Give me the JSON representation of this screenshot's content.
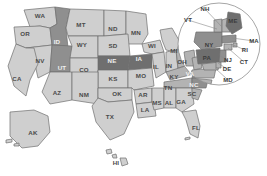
{
  "map": {
    "title_partial": "Percentage of Households, by State",
    "title_visible": false,
    "projection": "albers-usa",
    "background_color": "#ffffff",
    "border_color": "#6e6e6e",
    "shade_levels": {
      "light": "#cfcfcf",
      "medium": "#b3b3b3",
      "dark": "#8f8f8f",
      "darkest": "#6f6f6f"
    },
    "inset": {
      "name": "northeast-inset",
      "shape": "circle",
      "center_x": 219,
      "center_y": 44,
      "radius": 41
    },
    "states": [
      {
        "code": "WA",
        "shade": "light",
        "lx": 40,
        "ly": 16
      },
      {
        "code": "OR",
        "shade": "light",
        "lx": 25,
        "ly": 34
      },
      {
        "code": "ID",
        "shade": "dark",
        "lx": 57,
        "ly": 42
      },
      {
        "code": "MT",
        "shade": "light",
        "lx": 81,
        "ly": 25
      },
      {
        "code": "ND",
        "shade": "light",
        "lx": 113,
        "ly": 29
      },
      {
        "code": "MN",
        "shade": "light",
        "lx": 136,
        "ly": 33
      },
      {
        "code": "WI",
        "shade": "light",
        "lx": 152,
        "ly": 46
      },
      {
        "code": "MI",
        "shade": "light",
        "lx": 174,
        "ly": 51
      },
      {
        "code": "NV",
        "shade": "light",
        "lx": 40,
        "ly": 61
      },
      {
        "code": "UT",
        "shade": "dark",
        "lx": 62,
        "ly": 68
      },
      {
        "code": "WY",
        "shade": "light",
        "lx": 82,
        "ly": 45
      },
      {
        "code": "SD",
        "shade": "light",
        "lx": 113,
        "ly": 46
      },
      {
        "code": "NE",
        "shade": "darkest",
        "lx": 112,
        "ly": 61
      },
      {
        "code": "IA",
        "shade": "darkest",
        "lx": 139,
        "ly": 59
      },
      {
        "code": "CA",
        "shade": "light",
        "lx": 17,
        "ly": 79
      },
      {
        "code": "CO",
        "shade": "light",
        "lx": 84,
        "ly": 70
      },
      {
        "code": "KS",
        "shade": "light",
        "lx": 113,
        "ly": 79
      },
      {
        "code": "MO",
        "shade": "light",
        "lx": 141,
        "ly": 76
      },
      {
        "code": "IL",
        "shade": "light",
        "lx": 156,
        "ly": 67
      },
      {
        "code": "IN",
        "shade": "light",
        "lx": 169,
        "ly": 66
      },
      {
        "code": "OH",
        "shade": "medium",
        "lx": 182,
        "ly": 62
      },
      {
        "code": "AZ",
        "shade": "light",
        "lx": 57,
        "ly": 93
      },
      {
        "code": "NM",
        "shade": "light",
        "lx": 84,
        "ly": 95
      },
      {
        "code": "OK",
        "shade": "light",
        "lx": 117,
        "ly": 94
      },
      {
        "code": "AR",
        "shade": "light",
        "lx": 143,
        "ly": 95
      },
      {
        "code": "KY",
        "shade": "medium",
        "lx": 174,
        "ly": 77
      },
      {
        "code": "TN",
        "shade": "medium",
        "lx": 168,
        "ly": 88
      },
      {
        "code": "TX",
        "shade": "light",
        "lx": 110,
        "ly": 117
      },
      {
        "code": "LA",
        "shade": "light",
        "lx": 145,
        "ly": 110
      },
      {
        "code": "MS",
        "shade": "light",
        "lx": 157,
        "ly": 103
      },
      {
        "code": "AL",
        "shade": "light",
        "lx": 169,
        "ly": 103
      },
      {
        "code": "GA",
        "shade": "light",
        "lx": 181,
        "ly": 102
      },
      {
        "code": "FL",
        "shade": "light",
        "lx": 196,
        "ly": 128
      },
      {
        "code": "SC",
        "shade": "medium",
        "lx": 192,
        "ly": 94
      },
      {
        "code": "NC",
        "shade": "dark",
        "lx": 194,
        "ly": 85
      },
      {
        "code": "VA",
        "shade": "dark",
        "lx": 190,
        "ly": 74
      },
      {
        "code": "AK",
        "shade": "light",
        "lx": 33,
        "ly": 133
      },
      {
        "code": "HI",
        "shade": "light",
        "lx": 116,
        "ly": 163
      }
    ],
    "inset_states": [
      {
        "code": "ME",
        "shade": "darkest",
        "lx": 233,
        "ly": 21,
        "leader": false
      },
      {
        "code": "NY",
        "shade": "dark",
        "lx": 209,
        "ly": 45,
        "leader": false
      },
      {
        "code": "PA",
        "shade": "darkest",
        "lx": 207,
        "ly": 58,
        "leader": false
      },
      {
        "code": "VT",
        "shade": "medium",
        "lx": 188,
        "ly": 20,
        "leader": true,
        "lx2": 217,
        "ly2": 29
      },
      {
        "code": "NH",
        "shade": "medium",
        "lx": 205,
        "ly": 9,
        "leader": true,
        "lx2": 222,
        "ly2": 27
      },
      {
        "code": "MA",
        "shade": "dark",
        "lx": 254,
        "ly": 41,
        "leader": true,
        "lx2": 232,
        "ly2": 38
      },
      {
        "code": "RI",
        "shade": "medium",
        "lx": 245,
        "ly": 50,
        "leader": true,
        "lx2": 231,
        "ly2": 44
      },
      {
        "code": "CT",
        "shade": "medium",
        "lx": 244,
        "ly": 62,
        "leader": true,
        "lx2": 228,
        "ly2": 48
      },
      {
        "code": "NJ",
        "shade": "dark",
        "lx": 228,
        "ly": 60,
        "leader": true,
        "lx2": 220,
        "ly2": 56
      },
      {
        "code": "DE",
        "shade": "medium",
        "lx": 227,
        "ly": 69,
        "leader": true,
        "lx2": 218,
        "ly2": 63
      },
      {
        "code": "MD",
        "shade": "medium",
        "lx": 228,
        "ly": 80,
        "leader": true,
        "lx2": 215,
        "ly2": 68
      }
    ]
  }
}
